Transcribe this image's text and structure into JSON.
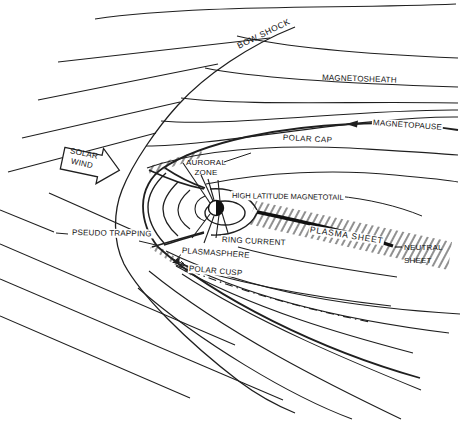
{
  "diagram": {
    "type": "magnetosphere-cross-section",
    "background_color": "#ffffff",
    "ink_color": "#1f1f1f",
    "labels": {
      "bow_shock": "BOW SHOCK",
      "magnetosheath": "MAGNETOSHEATH",
      "magnetopause": "MAGNETOPAUSE",
      "polar_cap": "POLAR CAP",
      "solar_wind_line1": "SOLAR",
      "solar_wind_line2": "WIND",
      "auroral_zone_line1": "AURORAL",
      "auroral_zone_line2": "ZONE",
      "high_latitude_magnetotail": "HIGH LATITUDE MAGNETOTAIL",
      "plasma_sheet": "PLASMA SHEET",
      "neutral_sheet_line1": "NEUTRAL",
      "neutral_sheet_line2": "SHEET",
      "ring_current": "RING CURRENT",
      "plasmasphere": "PLASMASPHERE",
      "polar_cusp": "POLAR CUSP",
      "pseudo_trapping": "PSEUDO TRAPPING"
    }
  }
}
